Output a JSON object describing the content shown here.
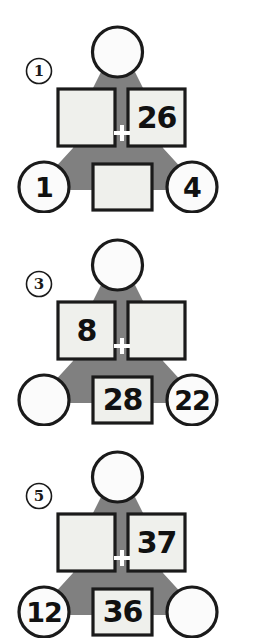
{
  "worksheet": {
    "background_color": "#ffffff",
    "body_color": "#808080",
    "tile_fill_color": "#eff0ec",
    "outline_color": "#1a1a1a",
    "plus_color": "#ffffff",
    "plus_symbol": "+"
  },
  "puzzles": [
    {
      "index_label": "1",
      "head": {
        "value": "",
        "filled": false
      },
      "left_addend": {
        "value": "",
        "filled": false
      },
      "right_addend": {
        "value": "26",
        "filled": true
      },
      "left_foot": {
        "value": "1",
        "filled": true
      },
      "center_foot": {
        "value": "",
        "filled": false
      },
      "right_foot": {
        "value": "4",
        "filled": true
      }
    },
    {
      "index_label": "3",
      "head": {
        "value": "",
        "filled": false
      },
      "left_addend": {
        "value": "8",
        "filled": true
      },
      "right_addend": {
        "value": "",
        "filled": false
      },
      "left_foot": {
        "value": "",
        "filled": false
      },
      "center_foot": {
        "value": "28",
        "filled": true
      },
      "right_foot": {
        "value": "22",
        "filled": true
      }
    },
    {
      "index_label": "5",
      "head": {
        "value": "",
        "filled": false
      },
      "left_addend": {
        "value": "",
        "filled": false
      },
      "right_addend": {
        "value": "37",
        "filled": true
      },
      "left_foot": {
        "value": "12",
        "filled": true
      },
      "center_foot": {
        "value": "36",
        "filled": true
      },
      "right_foot": {
        "value": "",
        "filled": false
      }
    }
  ]
}
